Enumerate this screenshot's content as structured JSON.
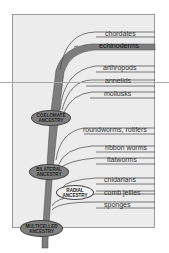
{
  "diagram": {
    "type": "phylogenetic-tree",
    "colors": {
      "panel": "#ececec",
      "trunk": "#7d7d7d",
      "highlight_branch": "#8a8a8a",
      "node_fill": "#808080",
      "radial_node_fill": "#f2f2f2",
      "lines": "#444444"
    },
    "taxa": [
      {
        "label": "chordates",
        "highlighted": false
      },
      {
        "label": "echinoderms",
        "highlighted": true
      },
      {
        "label": "arthropods",
        "highlighted": false
      },
      {
        "label": "annelids",
        "highlighted": false
      },
      {
        "label": "mollusks",
        "highlighted": false
      },
      {
        "label": "roundworms, rotifers",
        "highlighted": false
      },
      {
        "label": "ribbon worms",
        "highlighted": false
      },
      {
        "label": "flatworms",
        "highlighted": false
      },
      {
        "label": "cnidarians",
        "highlighted": false
      },
      {
        "label": "comb jellies",
        "highlighted": false
      },
      {
        "label": "sponges",
        "highlighted": false
      }
    ],
    "nodes": {
      "coelomate": {
        "line1": "COELOMATE",
        "line2": "ANCESTRY"
      },
      "bilateral": {
        "line1": "BILATERAL",
        "line2": "ANCESTRY"
      },
      "radial": {
        "line1": "RADIAL",
        "line2": "ANCESTRY"
      },
      "multicelled": {
        "line1": "MULTICELLED",
        "line2": "ANCESTRY"
      }
    }
  }
}
